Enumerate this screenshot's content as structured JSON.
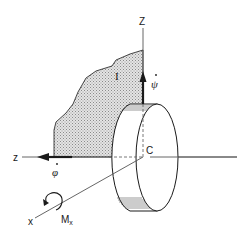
{
  "figure": {
    "type": "gyroscope-disk-diagram",
    "labels": {
      "z_axis_vertical": "Z",
      "z_axis_horizontal": "z",
      "x_axis": "x",
      "inertia_region": "I",
      "precession_rate": "ψ",
      "spin_rate": "φ",
      "center": "C",
      "moment": "M",
      "moment_subscript": "x"
    },
    "colors": {
      "line": "#1a1a1a",
      "shaded_fill": "#c8c8c8",
      "axis": "#555555",
      "background": "#ffffff"
    }
  }
}
